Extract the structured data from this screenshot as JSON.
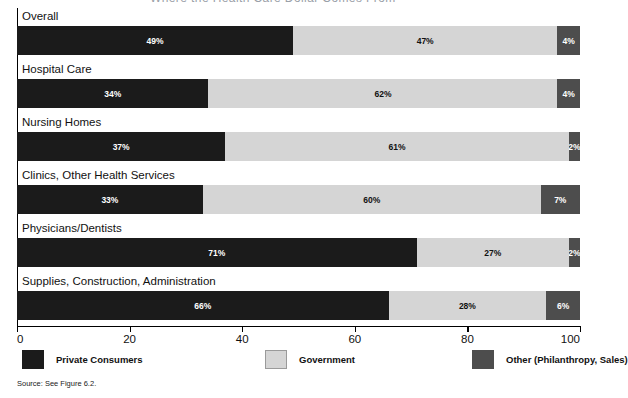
{
  "figure": {
    "clipped_title_fragment": "Where the Health Care Dollar Comes From",
    "source_note": "Source: See Figure 6.2."
  },
  "chart_data": {
    "type": "bar",
    "orientation": "horizontal",
    "stacked": true,
    "title": "",
    "xlabel": "",
    "ylabel": "",
    "xlim": [
      0,
      100
    ],
    "xticks": [
      0,
      20,
      40,
      60,
      80,
      100
    ],
    "xticklabels": [
      "0",
      "20",
      "40",
      "60",
      "80",
      "100"
    ],
    "grid": false,
    "legend_position": "below-axis",
    "categories": [
      "Overall",
      "Hospital Care",
      "Nursing Homes",
      "Clinics, Other Health Services",
      "Physicians/Dentists",
      "Supplies, Construction, Administration"
    ],
    "series": [
      {
        "name": "Private Consumers",
        "color": "#1b1b1b",
        "values": [
          49,
          34,
          37,
          33,
          71,
          66
        ],
        "labels": [
          "49%",
          "34%",
          "37%",
          "33%",
          "71%",
          "66%"
        ]
      },
      {
        "name": "Government",
        "color": "#d5d5d5",
        "values": [
          47,
          62,
          61,
          60,
          27,
          28
        ],
        "labels": [
          "47%",
          "62%",
          "61%",
          "60%",
          "27%",
          "28%"
        ]
      },
      {
        "name": "Other (Philanthropy, Sales)",
        "color": "#4d4d4d",
        "values": [
          4,
          4,
          2,
          7,
          2,
          6
        ],
        "labels": [
          "4%",
          "4%",
          "2%",
          "7%",
          "2%",
          "6%"
        ]
      }
    ]
  }
}
